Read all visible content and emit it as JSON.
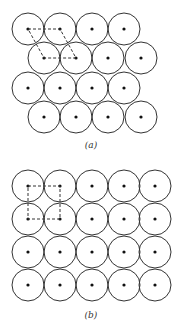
{
  "panels": [
    {
      "id": "a",
      "label": "(a)",
      "arrangement": "hexagonal close packing",
      "radius": 16,
      "rows": [
        {
          "y": 29,
          "xs": [
            28,
            60,
            92,
            124
          ]
        },
        {
          "y": 58,
          "xs": [
            44,
            76,
            108,
            141
          ]
        },
        {
          "y": 88,
          "xs": [
            28,
            60,
            92,
            124
          ]
        },
        {
          "y": 117,
          "xs": [
            44,
            76,
            108,
            141
          ]
        }
      ],
      "unit_cell": [
        [
          28,
          29
        ],
        [
          60,
          29
        ],
        [
          76,
          58
        ],
        [
          44,
          58
        ]
      ],
      "label_y": 140
    },
    {
      "id": "b",
      "label": "(b)",
      "arrangement": "square packing",
      "radius": 16,
      "rows": [
        {
          "y": 186,
          "xs": [
            28,
            60,
            92,
            124,
            155
          ]
        },
        {
          "y": 219,
          "xs": [
            28,
            60,
            92,
            124,
            155
          ]
        },
        {
          "y": 252,
          "xs": [
            28,
            60,
            92,
            124,
            155
          ]
        },
        {
          "y": 285,
          "xs": [
            28,
            60,
            92,
            124,
            155
          ]
        }
      ],
      "unit_cell": [
        [
          28,
          186
        ],
        [
          60,
          186
        ],
        [
          60,
          219
        ],
        [
          28,
          219
        ]
      ],
      "label_y": 310
    }
  ],
  "colors": {
    "stroke": "#333333",
    "dot": "#111111",
    "background": "#ffffff"
  }
}
